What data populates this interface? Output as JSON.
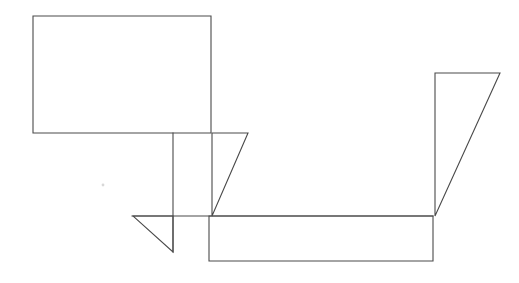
{
  "document": {
    "title": "Line Drawing",
    "type": "monochrome-line-figure",
    "canvas": {
      "width": 519,
      "height": 283,
      "background_color": "#ffffff"
    },
    "style": {
      "stroke_color": "#4a4a4a",
      "stroke_width": 1.1,
      "fill": "none",
      "speck_color": "#d8d8d8"
    }
  },
  "figure": {
    "shapes": [
      {
        "id": "large-rectangle",
        "name": "large-rectangle",
        "kind": "rectangle",
        "points": "33,16 211,16 211,133 33,133 33,16",
        "bounds": {
          "x": 33,
          "y": 16,
          "width": 178,
          "height": 117
        }
      },
      {
        "id": "left-triangle",
        "name": "left-triangle",
        "kind": "triangle",
        "points": "212,133 248,133 212,216 212,133",
        "bounds": {
          "x": 212,
          "y": 133,
          "width": 36,
          "height": 83
        }
      },
      {
        "id": "vertical-line",
        "name": "vertical-line",
        "kind": "line",
        "points": "173,133 173,252",
        "bounds": {
          "x": 173,
          "y": 133,
          "width": 0,
          "height": 119
        }
      },
      {
        "id": "small-triangle",
        "name": "small-triangle",
        "kind": "triangle",
        "points": "133,216 173,216 173,252 133,216",
        "bounds": {
          "x": 133,
          "y": 216,
          "width": 40,
          "height": 36
        }
      },
      {
        "id": "horizontal-line",
        "name": "horizontal-line",
        "kind": "line",
        "points": "132,216 433,216",
        "bounds": {
          "x": 132,
          "y": 216,
          "width": 301,
          "height": 0
        }
      },
      {
        "id": "bottom-rectangle",
        "name": "bottom-rectangle",
        "kind": "rectangle",
        "points": "209,216 433,216 433,261 209,261 209,216",
        "bounds": {
          "x": 209,
          "y": 216,
          "width": 224,
          "height": 45
        }
      },
      {
        "id": "right-triangle",
        "name": "right-triangle",
        "kind": "triangle",
        "points": "435,73 500,73 435,216 435,73",
        "bounds": {
          "x": 435,
          "y": 73,
          "width": 65,
          "height": 143
        }
      }
    ],
    "marks": [
      {
        "id": "speck",
        "name": "speck-mark",
        "kind": "dot",
        "cx": 103,
        "cy": 185,
        "r": 1.4
      }
    ]
  }
}
